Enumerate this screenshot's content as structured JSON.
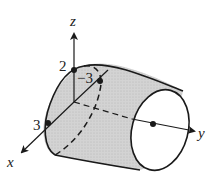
{
  "figure": {
    "axes": {
      "x_label": "x",
      "y_label": "y",
      "z_label": "z"
    },
    "points": [
      {
        "label": "2",
        "meaning": "z-intercept"
      },
      {
        "label": "−3",
        "meaning": "cross-section point"
      },
      {
        "label": "3",
        "meaning": "x-intercept"
      }
    ],
    "colors": {
      "stroke": "#1a1a1a",
      "shade": "#cfcfcf",
      "background": "#ffffff"
    }
  }
}
